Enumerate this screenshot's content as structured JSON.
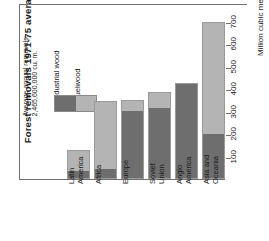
{
  "chart": {
    "title": "Forest removals 1971-75 average",
    "legend": {
      "note": "Average annual removals:\n2,465,600,000 cu. m.",
      "items": [
        {
          "label": "Industrial wood",
          "color": "#6e6e6e"
        },
        {
          "label": "Fuelwood",
          "color": "#b4b4b4"
        }
      ]
    },
    "axis": {
      "title": "Million cubic meters",
      "ticks": [
        "100",
        "200",
        "300",
        "400",
        "500",
        "600",
        "700"
      ]
    }
  },
  "chart_data": {
    "type": "bar",
    "stacked": true,
    "title": "Forest removals 1971-75 average",
    "subtitle": "Average annual removals: 2,465,600,000 cu. m.",
    "xlabel": "",
    "ylabel": "Million cubic meters",
    "ylim": [
      0,
      730
    ],
    "yticks": [
      100,
      200,
      300,
      400,
      500,
      600,
      700
    ],
    "grid": false,
    "legend_position": "top-left",
    "categories": [
      "Latin\nAmerica",
      "Africa",
      "Europe",
      "Soviet\nUnion",
      "Anglo\nAmerica",
      "Asia and\nOceania"
    ],
    "series": [
      {
        "name": "Industrial wood",
        "color": "#6e6e6e",
        "values": [
          35,
          40,
          305,
          320,
          425,
          200
        ]
      },
      {
        "name": "Fuelwood",
        "color": "#b4b4b4",
        "values": [
          95,
          305,
          45,
          65,
          0,
          500
        ]
      }
    ],
    "totals": [
      130,
      345,
      350,
      385,
      425,
      700
    ]
  }
}
